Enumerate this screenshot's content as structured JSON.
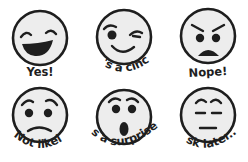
{
  "background": "#ffffff",
  "colors": {
    "face_fill": "#ededed",
    "ink": "#1e1e1e"
  },
  "faces": [
    {
      "id": "laughing",
      "icon": "laughing-face-icon",
      "label": "Yes!"
    },
    {
      "id": "winking",
      "icon": "winking-face-icon",
      "label": "It's a cinch"
    },
    {
      "id": "angry",
      "icon": "angry-face-icon",
      "label": "Nope!"
    },
    {
      "id": "worried",
      "icon": "worried-face-icon",
      "label": "Not likely"
    },
    {
      "id": "surprised",
      "icon": "surprised-face-icon",
      "label": "It's a surprise..."
    },
    {
      "id": "expressionless",
      "icon": "expressionless-face-icon",
      "label": "Ask later..."
    }
  ]
}
